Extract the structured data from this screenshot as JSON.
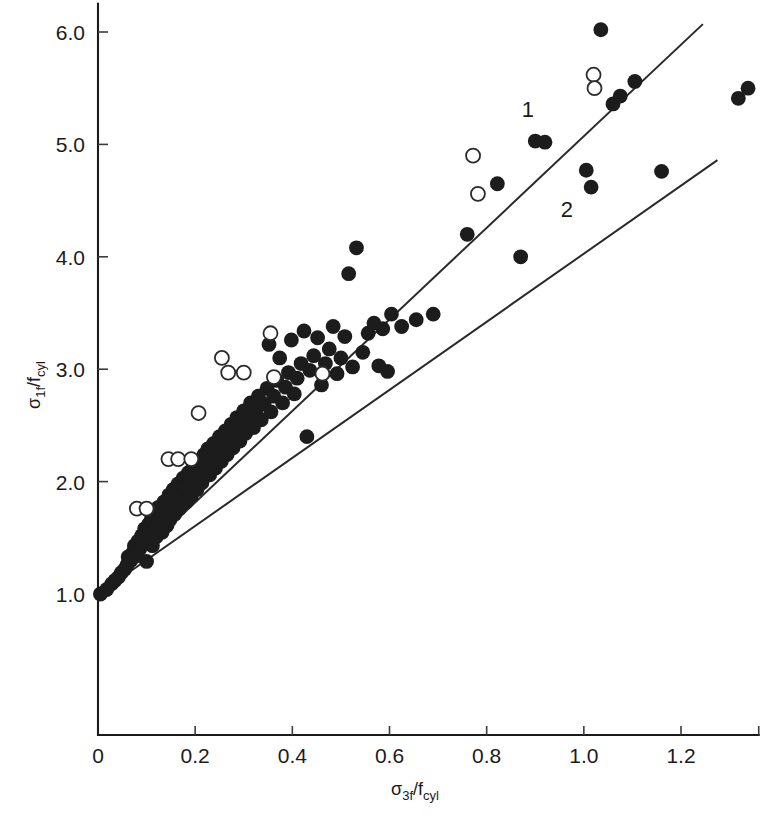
{
  "chart_data": {
    "type": "scatter",
    "title": "",
    "xlabel": "σ₃ｆ/ｆcyl",
    "ylabel": "σ₁ｆ/ｆcyl",
    "xlabel_parts": {
      "sigma": "σ",
      "sub": "3f",
      "slash": "/f",
      "sub2": "cyl"
    },
    "ylabel_parts": {
      "sigma": "σ",
      "sub": "1f",
      "slash": "/f",
      "sub2": "cyl"
    },
    "xlim": [
      0,
      1.36
    ],
    "ylim": [
      0.0,
      6.25
    ],
    "grid": false,
    "legend_position": "none",
    "xticks": [
      0,
      0.2,
      0.4,
      0.6,
      0.8,
      1.0,
      1.2
    ],
    "xtick_labels": [
      "0",
      "0.2",
      "0.4",
      "0.6",
      "0.8",
      "1.0",
      "1.2"
    ],
    "yticks": [
      1.0,
      2.0,
      3.0,
      4.0,
      5.0,
      6.0
    ],
    "ytick_labels": [
      "1.0",
      "2.0",
      "3.0",
      "4.0",
      "5.0",
      "6.0"
    ],
    "annotations": [
      {
        "text": "1",
        "x": 0.885,
        "y": 5.24,
        "name": "curve-label-1"
      },
      {
        "text": "2",
        "x": 0.965,
        "y": 4.35,
        "name": "curve-label-2"
      }
    ],
    "series": [
      {
        "name": "fit-line-1",
        "type": "line",
        "marker": "none",
        "label": "1",
        "points": [
          [
            0.0,
            1.0
          ],
          [
            1.245,
            6.07
          ]
        ]
      },
      {
        "name": "fit-line-2",
        "type": "line",
        "marker": "none",
        "label": "2",
        "points": [
          [
            0.0,
            1.0
          ],
          [
            1.275,
            4.86
          ]
        ]
      },
      {
        "name": "filled-circles",
        "type": "scatter",
        "marker": "filled-circle",
        "color": "#1c1c1c",
        "points": [
          [
            0.005,
            1.0
          ],
          [
            0.018,
            1.04
          ],
          [
            0.028,
            1.09
          ],
          [
            0.035,
            1.12
          ],
          [
            0.042,
            1.15
          ],
          [
            0.048,
            1.19
          ],
          [
            0.055,
            1.22
          ],
          [
            0.06,
            1.26
          ],
          [
            0.062,
            1.33
          ],
          [
            0.068,
            1.3
          ],
          [
            0.072,
            1.37
          ],
          [
            0.075,
            1.43
          ],
          [
            0.08,
            1.34
          ],
          [
            0.082,
            1.47
          ],
          [
            0.086,
            1.4
          ],
          [
            0.09,
            1.52
          ],
          [
            0.092,
            1.45
          ],
          [
            0.096,
            1.58
          ],
          [
            0.098,
            1.49
          ],
          [
            0.1,
            1.29
          ],
          [
            0.104,
            1.62
          ],
          [
            0.106,
            1.54
          ],
          [
            0.11,
            1.67
          ],
          [
            0.112,
            1.43
          ],
          [
            0.116,
            1.72
          ],
          [
            0.118,
            1.59
          ],
          [
            0.12,
            1.51
          ],
          [
            0.124,
            1.77
          ],
          [
            0.126,
            1.64
          ],
          [
            0.13,
            1.7
          ],
          [
            0.132,
            1.55
          ],
          [
            0.136,
            1.82
          ],
          [
            0.14,
            1.74
          ],
          [
            0.142,
            1.61
          ],
          [
            0.146,
            1.88
          ],
          [
            0.148,
            1.66
          ],
          [
            0.152,
            1.79
          ],
          [
            0.155,
            1.93
          ],
          [
            0.158,
            1.71
          ],
          [
            0.162,
            1.84
          ],
          [
            0.165,
            1.98
          ],
          [
            0.168,
            1.76
          ],
          [
            0.172,
            1.89
          ],
          [
            0.175,
            2.03
          ],
          [
            0.178,
            1.95
          ],
          [
            0.182,
            1.82
          ],
          [
            0.186,
            2.08
          ],
          [
            0.19,
            2.0
          ],
          [
            0.192,
            1.87
          ],
          [
            0.196,
            2.13
          ],
          [
            0.2,
            2.05
          ],
          [
            0.204,
            1.93
          ],
          [
            0.208,
            2.18
          ],
          [
            0.212,
            2.1
          ],
          [
            0.214,
            1.99
          ],
          [
            0.218,
            2.24
          ],
          [
            0.222,
            2.15
          ],
          [
            0.226,
            2.29
          ],
          [
            0.23,
            2.06
          ],
          [
            0.234,
            2.2
          ],
          [
            0.238,
            2.34
          ],
          [
            0.242,
            2.12
          ],
          [
            0.246,
            2.26
          ],
          [
            0.25,
            2.4
          ],
          [
            0.254,
            2.18
          ],
          [
            0.258,
            2.33
          ],
          [
            0.262,
            2.45
          ],
          [
            0.266,
            2.24
          ],
          [
            0.27,
            2.38
          ],
          [
            0.274,
            2.51
          ],
          [
            0.278,
            2.3
          ],
          [
            0.282,
            2.44
          ],
          [
            0.286,
            2.57
          ],
          [
            0.292,
            2.36
          ],
          [
            0.296,
            2.5
          ],
          [
            0.3,
            2.63
          ],
          [
            0.304,
            2.43
          ],
          [
            0.31,
            2.56
          ],
          [
            0.314,
            2.7
          ],
          [
            0.32,
            2.48
          ],
          [
            0.325,
            2.62
          ],
          [
            0.33,
            2.76
          ],
          [
            0.336,
            2.55
          ],
          [
            0.342,
            2.69
          ],
          [
            0.348,
            2.83
          ],
          [
            0.352,
            3.22
          ],
          [
            0.356,
            2.62
          ],
          [
            0.362,
            2.76
          ],
          [
            0.368,
            2.9
          ],
          [
            0.374,
            3.1
          ],
          [
            0.38,
            2.7
          ],
          [
            0.386,
            2.84
          ],
          [
            0.392,
            2.97
          ],
          [
            0.398,
            3.26
          ],
          [
            0.404,
            2.78
          ],
          [
            0.41,
            2.92
          ],
          [
            0.418,
            3.05
          ],
          [
            0.424,
            3.34
          ],
          [
            0.43,
            2.4
          ],
          [
            0.436,
            2.99
          ],
          [
            0.444,
            3.12
          ],
          [
            0.452,
            3.28
          ],
          [
            0.46,
            2.86
          ],
          [
            0.468,
            3.05
          ],
          [
            0.476,
            3.18
          ],
          [
            0.484,
            3.38
          ],
          [
            0.492,
            2.96
          ],
          [
            0.5,
            3.1
          ],
          [
            0.508,
            3.29
          ],
          [
            0.516,
            3.85
          ],
          [
            0.524,
            3.02
          ],
          [
            0.532,
            4.08
          ],
          [
            0.545,
            3.15
          ],
          [
            0.556,
            3.32
          ],
          [
            0.568,
            3.41
          ],
          [
            0.578,
            3.03
          ],
          [
            0.586,
            3.36
          ],
          [
            0.596,
            2.98
          ],
          [
            0.604,
            3.49
          ],
          [
            0.625,
            3.38
          ],
          [
            0.655,
            3.44
          ],
          [
            0.69,
            3.49
          ],
          [
            0.76,
            4.2
          ],
          [
            0.822,
            4.65
          ],
          [
            0.87,
            4.0
          ],
          [
            0.9,
            5.03
          ],
          [
            0.92,
            5.02
          ],
          [
            1.005,
            4.77
          ],
          [
            1.015,
            4.62
          ],
          [
            1.035,
            6.02
          ],
          [
            1.06,
            5.36
          ],
          [
            1.075,
            5.43
          ],
          [
            1.105,
            5.56
          ],
          [
            1.16,
            4.76
          ],
          [
            1.318,
            5.41
          ],
          [
            1.338,
            5.5
          ]
        ]
      },
      {
        "name": "open-circles",
        "type": "scatter",
        "marker": "open-circle",
        "color": "#ffffff",
        "points": [
          [
            0.08,
            1.76
          ],
          [
            0.1,
            1.76
          ],
          [
            0.145,
            2.2
          ],
          [
            0.165,
            2.2
          ],
          [
            0.192,
            2.2
          ],
          [
            0.207,
            2.61
          ],
          [
            0.255,
            3.1
          ],
          [
            0.268,
            2.97
          ],
          [
            0.3,
            2.97
          ],
          [
            0.355,
            3.32
          ],
          [
            0.362,
            2.93
          ],
          [
            0.462,
            2.96
          ],
          [
            0.772,
            4.9
          ],
          [
            0.782,
            4.56
          ],
          [
            1.02,
            5.62
          ],
          [
            1.022,
            5.5
          ]
        ]
      }
    ]
  }
}
